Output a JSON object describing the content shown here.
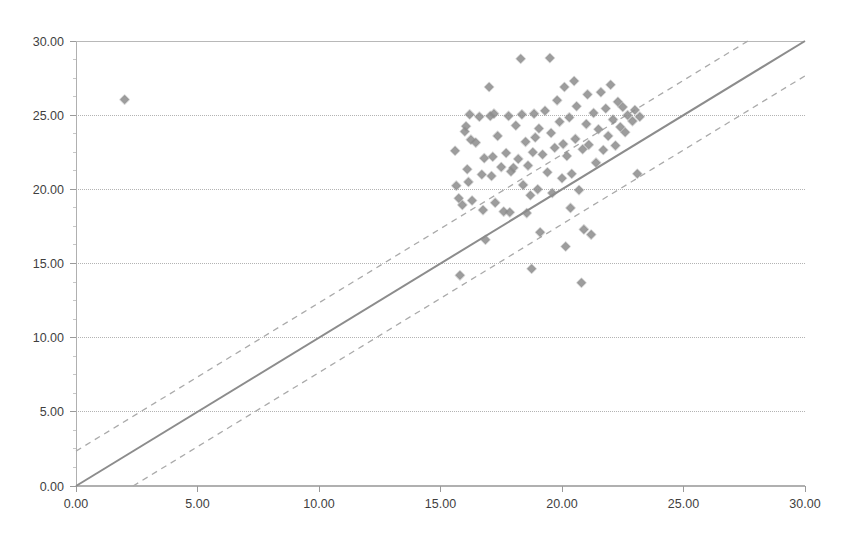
{
  "chart_data": {
    "type": "scatter",
    "title": "",
    "subtitle": "",
    "xlabel": "",
    "ylabel": "",
    "xlim": [
      0,
      30
    ],
    "ylim": [
      0,
      30
    ],
    "xticks": [
      0,
      5,
      10,
      15,
      20,
      25,
      30
    ],
    "yticks": [
      0,
      5,
      10,
      15,
      20,
      25,
      30
    ],
    "xtick_labels": [
      "0.00",
      "5.00",
      "10.00",
      "15.00",
      "20.00",
      "25.00",
      "30.00"
    ],
    "ytick_labels": [
      "0.00",
      "5.00",
      "10.00",
      "15.00",
      "20.00",
      "25.00",
      "30.00"
    ],
    "grid": {
      "horizontal": true,
      "vertical": false,
      "color": "#b3b3b3",
      "style": "dotted"
    },
    "legend": {
      "visible": false,
      "position": "none",
      "entries": []
    },
    "marker": {
      "shape": "diamond",
      "color": "#8c8c8c",
      "size": 9,
      "opacity": 0.85
    },
    "reference_lines": [
      {
        "name": "identity-line",
        "style": "solid",
        "color": "#8c8c8c",
        "width": 2.0,
        "slope": 1,
        "intercept": 0,
        "from": [
          0,
          0
        ],
        "to": [
          30,
          30
        ]
      },
      {
        "name": "upper-limit-of-agreement",
        "style": "dashed",
        "color": "#aaaaaa",
        "width": 1.3,
        "slope": 1,
        "intercept": 2.35,
        "from": [
          0,
          2.35
        ],
        "to": [
          27.65,
          30
        ]
      },
      {
        "name": "lower-limit-of-agreement",
        "style": "dashed",
        "color": "#aaaaaa",
        "width": 1.3,
        "slope": 1,
        "intercept": -2.35,
        "from": [
          2.35,
          0
        ],
        "to": [
          30,
          27.65
        ]
      }
    ],
    "series": [
      {
        "name": "measurements",
        "marker": "diamond",
        "color": "#8c8c8c",
        "points": [
          [
            2.0,
            26.05
          ],
          [
            15.6,
            22.6
          ],
          [
            15.65,
            20.25
          ],
          [
            15.75,
            19.4
          ],
          [
            15.8,
            14.2
          ],
          [
            15.9,
            18.95
          ],
          [
            16.0,
            23.9
          ],
          [
            16.05,
            24.25
          ],
          [
            16.1,
            21.35
          ],
          [
            16.15,
            20.5
          ],
          [
            16.2,
            25.05
          ],
          [
            16.25,
            23.35
          ],
          [
            16.3,
            19.25
          ],
          [
            16.45,
            23.15
          ],
          [
            16.6,
            24.9
          ],
          [
            16.7,
            21.0
          ],
          [
            16.75,
            18.6
          ],
          [
            16.8,
            22.1
          ],
          [
            16.85,
            16.6
          ],
          [
            17.0,
            26.9
          ],
          [
            17.05,
            24.95
          ],
          [
            17.1,
            20.9
          ],
          [
            17.15,
            22.2
          ],
          [
            17.2,
            25.1
          ],
          [
            17.25,
            19.1
          ],
          [
            17.35,
            23.6
          ],
          [
            17.5,
            21.5
          ],
          [
            17.6,
            18.5
          ],
          [
            17.7,
            22.45
          ],
          [
            17.8,
            24.95
          ],
          [
            17.85,
            18.45
          ],
          [
            17.9,
            21.2
          ],
          [
            18.0,
            21.45
          ],
          [
            18.1,
            24.3
          ],
          [
            18.2,
            22.05
          ],
          [
            18.3,
            28.8
          ],
          [
            18.35,
            25.05
          ],
          [
            18.4,
            20.3
          ],
          [
            18.5,
            23.2
          ],
          [
            18.55,
            18.4
          ],
          [
            18.6,
            21.6
          ],
          [
            18.7,
            19.6
          ],
          [
            18.75,
            14.65
          ],
          [
            18.8,
            22.5
          ],
          [
            18.85,
            25.1
          ],
          [
            18.9,
            23.5
          ],
          [
            19.0,
            20.0
          ],
          [
            19.05,
            24.1
          ],
          [
            19.1,
            17.1
          ],
          [
            19.2,
            22.35
          ],
          [
            19.3,
            25.3
          ],
          [
            19.4,
            21.15
          ],
          [
            19.5,
            28.85
          ],
          [
            19.55,
            23.8
          ],
          [
            19.6,
            19.75
          ],
          [
            19.7,
            22.8
          ],
          [
            19.8,
            26.0
          ],
          [
            19.9,
            24.55
          ],
          [
            20.0,
            20.75
          ],
          [
            20.05,
            23.05
          ],
          [
            20.1,
            26.9
          ],
          [
            20.15,
            16.15
          ],
          [
            20.2,
            22.25
          ],
          [
            20.3,
            24.85
          ],
          [
            20.35,
            18.75
          ],
          [
            20.4,
            21.05
          ],
          [
            20.5,
            27.3
          ],
          [
            20.55,
            23.4
          ],
          [
            20.6,
            25.6
          ],
          [
            20.7,
            19.95
          ],
          [
            20.8,
            13.7
          ],
          [
            20.85,
            22.7
          ],
          [
            20.9,
            17.3
          ],
          [
            21.0,
            24.4
          ],
          [
            21.05,
            26.4
          ],
          [
            21.1,
            23.0
          ],
          [
            21.2,
            16.95
          ],
          [
            21.3,
            25.15
          ],
          [
            21.4,
            21.8
          ],
          [
            21.5,
            24.05
          ],
          [
            21.6,
            26.55
          ],
          [
            21.7,
            22.65
          ],
          [
            21.8,
            25.45
          ],
          [
            21.9,
            23.6
          ],
          [
            22.0,
            27.05
          ],
          [
            22.1,
            24.7
          ],
          [
            22.2,
            22.95
          ],
          [
            22.3,
            25.9
          ],
          [
            22.4,
            24.2
          ],
          [
            22.5,
            25.55
          ],
          [
            22.6,
            23.85
          ],
          [
            22.7,
            25.0
          ],
          [
            22.9,
            24.6
          ],
          [
            23.0,
            25.35
          ],
          [
            23.1,
            21.05
          ],
          [
            23.2,
            24.9
          ]
        ]
      }
    ]
  },
  "plot_geometry": {
    "left": 76,
    "top": 41,
    "right": 805,
    "bottom": 486
  }
}
